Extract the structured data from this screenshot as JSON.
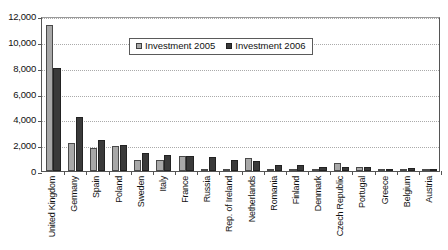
{
  "chart_data": {
    "type": "bar",
    "title": "",
    "subtitle": "",
    "xlabel": "",
    "ylabel": "",
    "ylim": [
      0,
      12000
    ],
    "yticks": [
      0,
      2000,
      4000,
      6000,
      8000,
      10000,
      12000
    ],
    "ytick_labels": [
      "0",
      "2,000",
      "4,000",
      "6,000",
      "8,000",
      "10,000",
      "12,000"
    ],
    "grid": true,
    "grid_axis": "y",
    "legend_position": "inside-top-center",
    "categories": [
      "United Kingdom",
      "Germany",
      "Spain",
      "Poland",
      "Sweden",
      "Italy",
      "France",
      "Russia",
      "Rep. of Ireland",
      "Netherlands",
      "Romania",
      "Finland",
      "Denmark",
      "Czech Republic",
      "Portugal",
      "Greece",
      "Belgium",
      "Austria"
    ],
    "series": [
      {
        "name": "Investment 2005",
        "color": "#a8a8a8",
        "values": [
          11300,
          2200,
          1750,
          1900,
          850,
          870,
          1150,
          150,
          60,
          1000,
          30,
          120,
          60,
          650,
          330,
          120,
          90,
          130
        ]
      },
      {
        "name": "Investment 2006",
        "color": "#3a3a3a",
        "values": [
          8000,
          4150,
          2400,
          1980,
          1420,
          1250,
          1140,
          1100,
          820,
          780,
          470,
          430,
          300,
          300,
          290,
          180,
          230,
          180
        ]
      }
    ]
  },
  "legend": {
    "items": [
      {
        "label": "Investment 2005",
        "swatch": "legend-swatch-2005"
      },
      {
        "label": "Investment 2006",
        "swatch": "legend-swatch-2006"
      }
    ]
  }
}
